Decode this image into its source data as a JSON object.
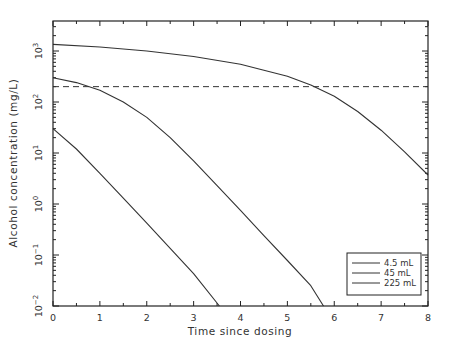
{
  "chart_data": {
    "type": "line",
    "title": "",
    "xlabel": "Time since dosing",
    "ylabel": "Alcohol concentration (mg/L)",
    "xlim": [
      0,
      8
    ],
    "ylim": [
      0.01,
      4000
    ],
    "yscale": "log",
    "x_ticks": [
      "0",
      "1",
      "2",
      "3",
      "4",
      "5",
      "6",
      "7",
      "8"
    ],
    "y_ticks": [
      {
        "base": "10",
        "exp": "-2",
        "value": 0.01
      },
      {
        "base": "10",
        "exp": "-1",
        "value": 0.1
      },
      {
        "base": "10",
        "exp": "0",
        "value": 1
      },
      {
        "base": "10",
        "exp": "1",
        "value": 10
      },
      {
        "base": "10",
        "exp": "2",
        "value": 100
      },
      {
        "base": "10",
        "exp": "3",
        "value": 1000
      }
    ],
    "grid": false,
    "legend_position": "lower right",
    "reference_line": {
      "style": "dashed",
      "y": 200
    },
    "series": [
      {
        "name": "4.5 mL",
        "x": [
          0,
          0.5,
          1.0,
          1.5,
          2.0,
          2.5,
          3.0,
          3.55
        ],
        "y": [
          30,
          12,
          4.0,
          1.3,
          0.42,
          0.135,
          0.043,
          0.01
        ]
      },
      {
        "name": "45 mL",
        "x": [
          0,
          0.5,
          1.0,
          1.5,
          2.0,
          2.5,
          3.0,
          3.5,
          4.0,
          4.5,
          5.0,
          5.5,
          5.77
        ],
        "y": [
          300,
          240,
          170,
          100,
          50,
          20,
          7,
          2.3,
          0.75,
          0.24,
          0.078,
          0.025,
          0.01
        ]
      },
      {
        "name": "225 mL",
        "x": [
          0,
          1,
          2,
          3,
          4,
          4.5,
          5,
          5.5,
          6,
          6.5,
          7,
          7.5,
          8
        ],
        "y": [
          1350,
          1200,
          1000,
          780,
          550,
          420,
          320,
          215,
          130,
          65,
          28,
          10.5,
          3.7
        ]
      }
    ],
    "legend": [
      "4.5 mL",
      "45 mL",
      "225 mL"
    ]
  }
}
